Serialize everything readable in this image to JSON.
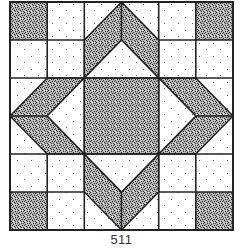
{
  "figure": {
    "caption": "511",
    "grid": {
      "rows": 6,
      "cols": 6
    },
    "colors": {
      "outline": "#222222",
      "dark_fill": "#8a8a8a",
      "light_fill": "#ffffff",
      "stipple_dark": "#1e1e1e",
      "stipple_light": "#555555"
    },
    "pieces": {
      "corner_squares": 4,
      "center_square": 1,
      "arrow_bands": 4,
      "light_squares": 16,
      "light_triangles": 12
    }
  }
}
